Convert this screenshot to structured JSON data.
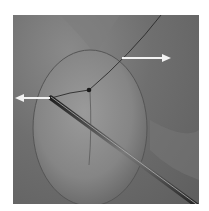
{
  "figure": {
    "arrows": [
      {
        "name": "left-traction-arrow",
        "direction": "left"
      },
      {
        "name": "right-traction-arrow",
        "direction": "right"
      }
    ],
    "colors": {
      "background": "#6a6a6a",
      "membrane": "#8e8e8e",
      "arrow": "#f2f2f2",
      "instrument": "#3a3a3a"
    }
  }
}
